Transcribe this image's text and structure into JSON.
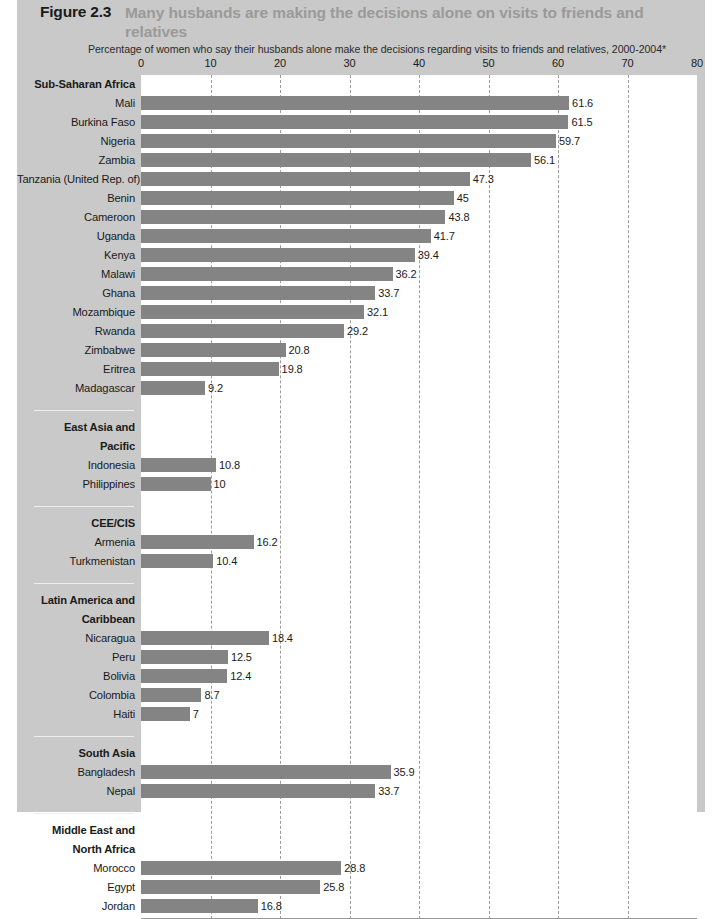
{
  "figure": {
    "number": "Figure 2.3",
    "title": "Many husbands are making the decisions alone on visits to friends and relatives",
    "subtitle": "Percentage of women who say their husbands alone make the decisions regarding visits to friends and relatives, 2000-2004*"
  },
  "colors": {
    "panel_background": "#c9c9c9",
    "plot_background": "#ffffff",
    "bar": "#848484",
    "title_accent": "#9a9a9a",
    "text": "#1a1a1a"
  },
  "chart_data": {
    "type": "bar",
    "orientation": "horizontal",
    "title": "Many husbands are making the decisions alone on visits to friends and relatives",
    "subtitle": "Percentage of women who say their husbands alone make the decisions regarding visits to friends and relatives, 2000-2004*",
    "xlabel": "",
    "ylabel": "",
    "xlim": [
      0,
      80
    ],
    "xticks": [
      0,
      10,
      20,
      30,
      40,
      50,
      60,
      70,
      80
    ],
    "grid": true,
    "legend": false,
    "groups": [
      {
        "region": "Sub-Saharan Africa",
        "region_lines": [
          "Sub-Saharan Africa"
        ],
        "categories": [
          "Mali",
          "Burkina Faso",
          "Nigeria",
          "Zambia",
          "Tanzania (United Rep. of)",
          "Benin",
          "Cameroon",
          "Uganda",
          "Kenya",
          "Malawi",
          "Ghana",
          "Mozambique",
          "Rwanda",
          "Zimbabwe",
          "Eritrea",
          "Madagascar"
        ],
        "values": [
          61.6,
          61.5,
          59.7,
          56.1,
          47.3,
          45,
          43.8,
          41.7,
          39.4,
          36.2,
          33.7,
          32.1,
          29.2,
          20.8,
          19.8,
          9.2
        ],
        "labels": [
          "61.6",
          "61.5",
          "59.7",
          "56.1",
          "47.3",
          "45",
          "43.8",
          "41.7",
          "39.4",
          "36.2",
          "33.7",
          "32.1",
          "29.2",
          "20.8",
          "19.8",
          "9.2"
        ]
      },
      {
        "region": "East Asia and Pacific",
        "region_lines": [
          "East Asia and",
          "Pacific"
        ],
        "categories": [
          "Indonesia",
          "Philippines"
        ],
        "values": [
          10.8,
          10
        ],
        "labels": [
          "10.8",
          "10"
        ]
      },
      {
        "region": "CEE/CIS",
        "region_lines": [
          "CEE/CIS"
        ],
        "categories": [
          "Armenia",
          "Turkmenistan"
        ],
        "values": [
          16.2,
          10.4
        ],
        "labels": [
          "16.2",
          "10.4"
        ]
      },
      {
        "region": "Latin America and Caribbean",
        "region_lines": [
          "Latin America and",
          "Caribbean"
        ],
        "categories": [
          "Nicaragua",
          "Peru",
          "Bolivia",
          "Colombia",
          "Haiti"
        ],
        "values": [
          18.4,
          12.5,
          12.4,
          8.7,
          7
        ],
        "labels": [
          "18.4",
          "12.5",
          "12.4",
          "8.7",
          "7"
        ]
      },
      {
        "region": "South Asia",
        "region_lines": [
          "South Asia"
        ],
        "categories": [
          "Bangladesh",
          "Nepal"
        ],
        "values": [
          35.9,
          33.7
        ],
        "labels": [
          "35.9",
          "33.7"
        ]
      },
      {
        "region": "Middle East and North Africa",
        "region_lines": [
          "Middle East and",
          "North Africa"
        ],
        "categories": [
          "Morocco",
          "Egypt",
          "Jordan"
        ],
        "values": [
          28.8,
          25.8,
          16.8
        ],
        "labels": [
          "28.8",
          "25.8",
          "16.8"
        ]
      }
    ]
  }
}
